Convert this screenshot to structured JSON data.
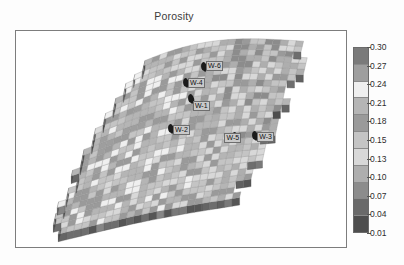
{
  "chart_data": {
    "type": "heatmap",
    "title": "Porosity",
    "subtitle": "",
    "xlabel": "",
    "ylabel": "",
    "colormap": "grayscale-discrete",
    "legend_position": "right",
    "grid": false,
    "colorbar": {
      "orientation": "vertical",
      "tick_labels": [
        "0.30",
        "0.27",
        "0.24",
        "0.21",
        "0.18",
        "0.15",
        "0.13",
        "0.10",
        "0.07",
        "0.04",
        "0.01"
      ],
      "tick_values": [
        0.3,
        0.27,
        0.24,
        0.21,
        0.18,
        0.15,
        0.13,
        0.1,
        0.07,
        0.04,
        0.01
      ],
      "range": [
        0.01,
        0.3
      ],
      "band_colors": [
        "#7a7a7a",
        "#9e9e9e",
        "#efefef",
        "#b5b5b5",
        "#9a9a9a",
        "#c4c4c4",
        "#d8d8d8",
        "#aeaeae",
        "#8c8c8c",
        "#6a6a6a",
        "#4e4e4e"
      ]
    },
    "wells": [
      {
        "name": "W-4",
        "x": 51.5,
        "y": 26.0,
        "label_dx": 2,
        "label_dy": -9
      },
      {
        "name": "W-1",
        "x": 53.0,
        "y": 33.5,
        "label_dx": 2,
        "label_dy": -2
      },
      {
        "name": "W-6",
        "x": 57.0,
        "y": 18.5,
        "label_dx": 2,
        "label_dy": -10
      },
      {
        "name": "W-2",
        "x": 47.0,
        "y": 47.0,
        "label_dx": 2,
        "label_dy": -8
      },
      {
        "name": "W-5",
        "x": 66.5,
        "y": 51.0,
        "label_dx": -11,
        "label_dy": -8
      },
      {
        "name": "W-3",
        "x": 72.5,
        "y": 50.5,
        "label_dx": 2,
        "label_dy": -8
      }
    ],
    "surface_note": "3D gridded reservoir-top surface, cell-by-cell porosity fill",
    "nx": 34,
    "ny": 26,
    "values_min": 0.01,
    "values_max": 0.3
  },
  "figure": {
    "title": "Porosity",
    "frame_border_color": "#7d7d7d",
    "background": "#ffffff"
  }
}
